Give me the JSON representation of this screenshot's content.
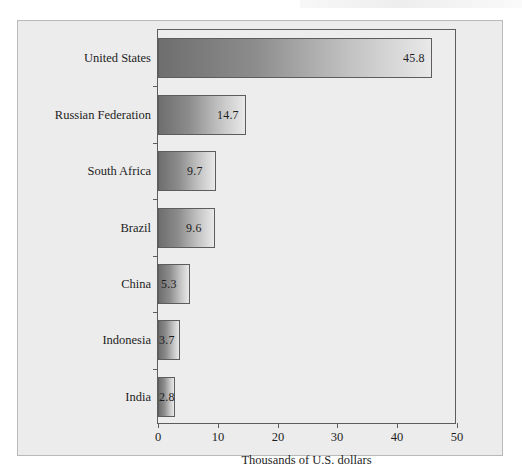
{
  "chart_data": {
    "type": "bar",
    "orientation": "horizontal",
    "title": "",
    "xlabel": "Thousands of U.S. dollars",
    "ylabel": "",
    "xlim": [
      0,
      50
    ],
    "xticks": [
      "0",
      "10",
      "20",
      "30",
      "40",
      "50"
    ],
    "xtick_values": [
      0,
      10,
      20,
      30,
      40,
      50
    ],
    "grid": false,
    "legend": null,
    "categories": [
      "United States",
      "Russian Federation",
      "South Africa",
      "Brazil",
      "China",
      "Indonesia",
      "India"
    ],
    "values": [
      45.8,
      14.7,
      9.7,
      9.6,
      5.3,
      3.7,
      2.8
    ],
    "value_labels": [
      "45.8",
      "14.7",
      "9.7",
      "9.6",
      "5.3",
      "3.7",
      "2.8"
    ],
    "series": [
      {
        "name": "",
        "values": [
          45.8,
          14.7,
          9.7,
          9.6,
          5.3,
          3.7,
          2.8
        ]
      }
    ],
    "colors": {
      "bar_gradient_start": "#6e6e6e",
      "bar_gradient_end": "#e9e9e9",
      "bar_border": "#5d5d5d",
      "plot_background": "#ededed",
      "card_background": "#ececec",
      "card_border": "#b9b9b9",
      "text": "#1d1d1d",
      "page_background": "#ffffff"
    }
  }
}
